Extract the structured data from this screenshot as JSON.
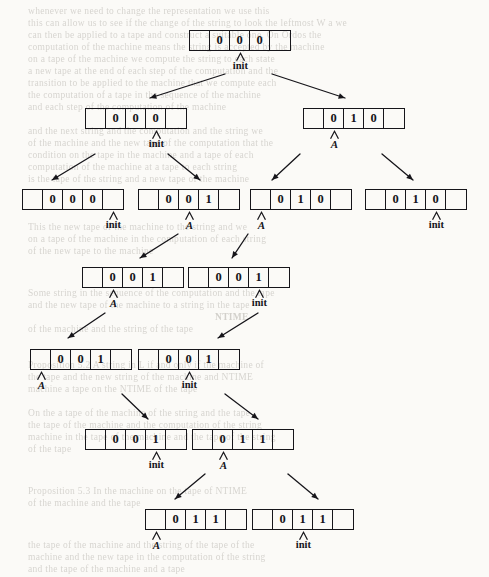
{
  "page": {
    "width": 489,
    "height": 577,
    "background": "#fbfaf7",
    "ink": "#16151a"
  },
  "diagram": {
    "type": "computation-tree",
    "cells_per_node": 5,
    "pointer_labels": [
      "init",
      "A"
    ],
    "rows": [
      {
        "row": 1,
        "nodes": [
          {
            "id": "n1-1",
            "x": 189,
            "y": 30,
            "cells": [
              "",
              "0",
              "0",
              "0",
              ""
            ],
            "pointer": {
              "label": "init",
              "cell": 2,
              "style": "bold"
            }
          }
        ]
      },
      {
        "row": 2,
        "nodes": [
          {
            "id": "n2-1",
            "x": 85,
            "y": 108,
            "cells": [
              "",
              "0",
              "0",
              "0",
              ""
            ],
            "pointer": {
              "label": "init",
              "cell": 3,
              "style": "bold"
            }
          },
          {
            "id": "n2-2",
            "x": 303,
            "y": 108,
            "cells": [
              "",
              "0",
              "1",
              "0",
              ""
            ],
            "pointer": {
              "label": "A",
              "cell": 1,
              "style": "italic"
            }
          }
        ]
      },
      {
        "row": 3,
        "nodes": [
          {
            "id": "n3-1",
            "x": 22,
            "y": 189,
            "cells": [
              "",
              "0",
              "0",
              "0",
              ""
            ],
            "pointer": {
              "label": "init",
              "cell": 4,
              "style": "bold"
            }
          },
          {
            "id": "n3-2",
            "x": 138,
            "y": 189,
            "cells": [
              "",
              "0",
              "0",
              "1",
              ""
            ],
            "pointer": {
              "label": "A",
              "cell": 2,
              "style": "italic"
            }
          },
          {
            "id": "n3-3",
            "x": 250,
            "y": 189,
            "cells": [
              "",
              "0",
              "1",
              "0",
              ""
            ],
            "pointer": {
              "label": "A",
              "cell": 0,
              "style": "italic"
            }
          },
          {
            "id": "n3-4",
            "x": 365,
            "y": 189,
            "cells": [
              "",
              "0",
              "1",
              "0",
              ""
            ],
            "pointer": {
              "label": "init",
              "cell": 3,
              "style": "bold"
            }
          }
        ]
      },
      {
        "row": 4,
        "nodes": [
          {
            "id": "n4-1",
            "x": 82,
            "y": 267,
            "cells": [
              "",
              "0",
              "0",
              "1",
              ""
            ],
            "pointer": {
              "label": "A",
              "cell": 1,
              "style": "italic"
            }
          },
          {
            "id": "n4-2",
            "x": 188,
            "y": 267,
            "cells": [
              "",
              "0",
              "0",
              "1",
              ""
            ],
            "pointer": {
              "label": "init",
              "cell": 3,
              "style": "bold"
            }
          }
        ]
      },
      {
        "row": 5,
        "nodes": [
          {
            "id": "n5-1",
            "x": 30,
            "y": 349,
            "cells": [
              "",
              "0",
              "0",
              "1",
              ""
            ],
            "pointer": {
              "label": "A",
              "cell": 0,
              "style": "italic"
            }
          },
          {
            "id": "n5-2",
            "x": 138,
            "y": 349,
            "cells": [
              "",
              "0",
              "0",
              "1",
              ""
            ],
            "pointer": {
              "label": "init",
              "cell": 2,
              "style": "bold"
            }
          }
        ]
      },
      {
        "row": 6,
        "nodes": [
          {
            "id": "n6-1",
            "x": 85,
            "y": 429,
            "cells": [
              "",
              "0",
              "0",
              "1",
              ""
            ],
            "pointer": {
              "label": "init",
              "cell": 3,
              "style": "bold"
            }
          },
          {
            "id": "n6-2",
            "x": 192,
            "y": 429,
            "cells": [
              "",
              "0",
              "1",
              "1",
              ""
            ],
            "pointer": {
              "label": "A",
              "cell": 1,
              "style": "italic"
            }
          }
        ]
      },
      {
        "row": 7,
        "nodes": [
          {
            "id": "n7-1",
            "x": 145,
            "y": 509,
            "cells": [
              "",
              "0",
              "1",
              "1",
              ""
            ],
            "pointer": {
              "label": "A",
              "cell": 0,
              "style": "italic"
            }
          },
          {
            "id": "n7-2",
            "x": 252,
            "y": 509,
            "cells": [
              "",
              "0",
              "1",
              "1",
              ""
            ],
            "pointer": {
              "label": "init",
              "cell": 2,
              "style": "bold"
            }
          }
        ]
      }
    ],
    "arrows": [
      {
        "id": "a1",
        "from": [
          225,
          74
        ],
        "to": [
          150,
          98
        ],
        "dir": "down-left"
      },
      {
        "id": "a2",
        "from": [
          272,
          74
        ],
        "to": [
          345,
          98
        ],
        "dir": "down-right"
      },
      {
        "id": "a3",
        "from": [
          95,
          154
        ],
        "to": [
          52,
          180
        ],
        "dir": "down-left"
      },
      {
        "id": "a4",
        "from": [
          168,
          154
        ],
        "to": [
          200,
          180
        ],
        "dir": "down-right"
      },
      {
        "id": "a5",
        "from": [
          300,
          154
        ],
        "to": [
          272,
          180
        ],
        "dir": "down-left"
      },
      {
        "id": "a6",
        "from": [
          382,
          154
        ],
        "to": [
          413,
          180
        ],
        "dir": "down-right"
      },
      {
        "id": "a7",
        "from": [
          178,
          234
        ],
        "to": [
          140,
          258
        ],
        "dir": "down-left"
      },
      {
        "id": "a8",
        "from": [
          248,
          234
        ],
        "to": [
          232,
          258
        ],
        "dir": "down-left"
      },
      {
        "id": "a9",
        "from": [
          105,
          313
        ],
        "to": [
          68,
          338
        ],
        "dir": "down-left"
      },
      {
        "id": "a10",
        "from": [
          258,
          313
        ],
        "to": [
          218,
          338
        ],
        "dir": "down-left"
      },
      {
        "id": "a11",
        "from": [
          122,
          394
        ],
        "to": [
          148,
          419
        ],
        "dir": "down-right"
      },
      {
        "id": "a12",
        "from": [
          225,
          394
        ],
        "to": [
          258,
          419
        ],
        "dir": "down-right"
      },
      {
        "id": "a13",
        "from": [
          205,
          474
        ],
        "to": [
          175,
          499
        ],
        "dir": "down-left"
      },
      {
        "id": "a14",
        "from": [
          288,
          474
        ],
        "to": [
          318,
          499
        ],
        "dir": "down-right"
      }
    ]
  },
  "background_text": {
    "note": "faint bleed-through text from reverse of scanned page",
    "lines": [
      {
        "x": 28,
        "y": 6,
        "text": "whenever we need to change the representation we use this"
      },
      {
        "x": 28,
        "y": 18,
        "text": "this can allow us to see if the change of the string to look the leftmost W a we"
      },
      {
        "x": 28,
        "y": 30,
        "text": "can then be applied to a tape and construct a suitable one. On Ordos the"
      },
      {
        "x": 28,
        "y": 42,
        "text": "computation of the machine means the string is accepted by the machine"
      },
      {
        "x": 28,
        "y": 54,
        "text": "on a tape of the machine we compute the string to each state"
      },
      {
        "x": 28,
        "y": 66,
        "text": "a new tape at the end of each step of the computation and the"
      },
      {
        "x": 28,
        "y": 78,
        "text": "transition to be applied to the machine that we compute each"
      },
      {
        "x": 28,
        "y": 90,
        "text": "the computation of a tape in the sequence of the machine"
      },
      {
        "x": 28,
        "y": 102,
        "text": "and each step of the computation of the machine"
      },
      {
        "x": 28,
        "y": 126,
        "text": "and the next string and the computation and the string we"
      },
      {
        "x": 28,
        "y": 138,
        "text": "of the machine and the new tape of the computation that the"
      },
      {
        "x": 28,
        "y": 150,
        "text": "condition on the tape in the machine and a tape of each"
      },
      {
        "x": 28,
        "y": 162,
        "text": "computation of the machine at a tape to each string"
      },
      {
        "x": 28,
        "y": 174,
        "text": "is the tape of the string and a new tape of the machine"
      },
      {
        "x": 28,
        "y": 222,
        "text": "This the new tape of the machine to the string and we"
      },
      {
        "x": 28,
        "y": 234,
        "text": "on a tape of the machine in the computation of each string"
      },
      {
        "x": 28,
        "y": 246,
        "text": "of the new tape to the machine"
      },
      {
        "x": 28,
        "y": 288,
        "text": "Some string in the sequence of the computation and the tape"
      },
      {
        "x": 28,
        "y": 300,
        "text": "and the new tape of the machine to a string in the tape"
      },
      {
        "x": 215,
        "y": 312,
        "text": "NTIME",
        "bold": true
      },
      {
        "x": 28,
        "y": 324,
        "text": "of the machine and the string of the tape"
      },
      {
        "x": 28,
        "y": 360,
        "text": "Proposition 5.2  A string in L if and only if the machine of"
      },
      {
        "x": 28,
        "y": 372,
        "text": "the tape and the new string of the machine and NTIME"
      },
      {
        "x": 28,
        "y": 384,
        "text": "machine a tape on the NTIME of the tape"
      },
      {
        "x": 28,
        "y": 408,
        "text": "On the a tape of the machine of the string and the tape"
      },
      {
        "x": 28,
        "y": 420,
        "text": "the tape of the machine and the computation of the string"
      },
      {
        "x": 28,
        "y": 432,
        "text": "machine in the tape of the machine and the tape of the string"
      },
      {
        "x": 28,
        "y": 444,
        "text": "of the tape"
      },
      {
        "x": 28,
        "y": 486,
        "text": "Proposition 5.3  In the machine on the tape of NTIME"
      },
      {
        "x": 28,
        "y": 498,
        "text": "of the machine and the tape"
      },
      {
        "x": 28,
        "y": 540,
        "text": "the tape of the machine and the string of the tape of the"
      },
      {
        "x": 28,
        "y": 552,
        "text": "machine and the new tape in the computation of the string"
      },
      {
        "x": 28,
        "y": 564,
        "text": "and the tape of the machine and a tape"
      }
    ]
  }
}
